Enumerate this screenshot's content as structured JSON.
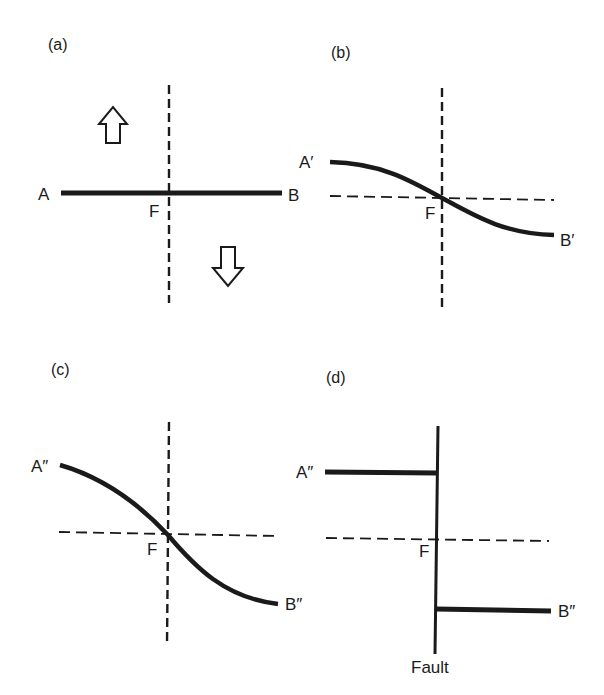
{
  "figure": {
    "panels": [
      {
        "id": "a",
        "label": "(a)",
        "point_left": "A",
        "point_right": "B",
        "center": "F",
        "arrows": [
          "up-arrow (left block)",
          "down-arrow (right block)"
        ]
      },
      {
        "id": "b",
        "label": "(b)",
        "point_left": "A′",
        "point_right": "B′",
        "center": "F"
      },
      {
        "id": "c",
        "label": "(c)",
        "point_left": "A″",
        "point_right": "B″",
        "center": "F"
      },
      {
        "id": "d",
        "label": "(d)",
        "point_left": "A″",
        "point_right": "B″",
        "center": "F",
        "fault_label": "Fault"
      }
    ],
    "colors": {
      "ink": "#1a1a1a",
      "background": "#ffffff"
    }
  }
}
